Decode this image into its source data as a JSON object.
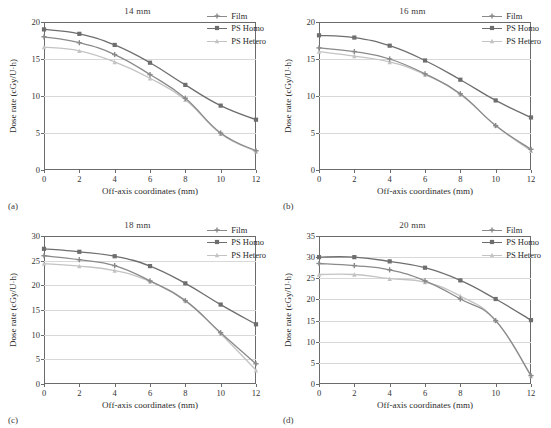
{
  "figure": {
    "panels": [
      {
        "label": "(a)",
        "title": "14 mm",
        "xlabel": "Off-axis coordinates (mm)",
        "ylabel": "Dose rate (cGy/U·h)",
        "ylim": [
          0,
          20
        ],
        "yticks": [
          0,
          5,
          10,
          15,
          20
        ],
        "xlim": [
          0,
          12
        ],
        "xticks": [
          0,
          2,
          4,
          6,
          8,
          10,
          12
        ]
      },
      {
        "label": "(b)",
        "title": "16 mm",
        "xlabel": "Off-axis coordinates (mm)",
        "ylabel": "Dose rate (cGy/U·h)",
        "ylim": [
          0,
          20
        ],
        "yticks": [
          0,
          5,
          10,
          15,
          20
        ],
        "xlim": [
          0,
          12
        ],
        "xticks": [
          0,
          2,
          4,
          6,
          8,
          10,
          12
        ]
      },
      {
        "label": "(c)",
        "title": "18 mm",
        "xlabel": "Off-axis coordinates (mm)",
        "ylabel": "Dose rate (cGy/U·h)",
        "ylim": [
          0,
          30
        ],
        "yticks": [
          0,
          5,
          10,
          15,
          20,
          25,
          30
        ],
        "xlim": [
          0,
          12
        ],
        "xticks": [
          0,
          2,
          4,
          6,
          8,
          10,
          12
        ]
      },
      {
        "label": "(d)",
        "title": "20 mm",
        "xlabel": "Off-axis coordinates (mm)",
        "ylabel": "Dose rate (cGy/U·h)",
        "ylim": [
          0,
          35
        ],
        "yticks": [
          0,
          5,
          10,
          15,
          20,
          25,
          30,
          35
        ],
        "xlim": [
          0,
          12
        ],
        "xticks": [
          0,
          2,
          4,
          6,
          8,
          10,
          12
        ]
      }
    ],
    "legend": {
      "position": "top-right",
      "entries": [
        {
          "name": "Film",
          "color": "#8a8a8a",
          "marker": "plus"
        },
        {
          "name": "PS Homo",
          "color": "#6e6e6e",
          "marker": "square"
        },
        {
          "name": "PS Hetero",
          "color": "#c3c3c3",
          "marker": "triangle"
        }
      ]
    }
  },
  "chart_data": [
    {
      "type": "line",
      "title": "14 mm",
      "panel": "(a)",
      "xlabel": "Off-axis coordinates (mm)",
      "ylabel": "Dose rate (cGy/U·h)",
      "x": [
        0,
        2,
        4,
        6,
        8,
        10,
        12
      ],
      "xlim": [
        0,
        12
      ],
      "ylim": [
        0,
        20
      ],
      "grid": true,
      "legend_position": "top-right",
      "series": [
        {
          "name": "Film",
          "color": "#8a8a8a",
          "marker": "plus",
          "values": [
            18.0,
            17.2,
            15.6,
            12.9,
            9.7,
            5.0,
            2.6
          ]
        },
        {
          "name": "PS Homo",
          "color": "#6e6e6e",
          "marker": "square",
          "values": [
            19.0,
            18.4,
            16.9,
            14.5,
            11.5,
            8.7,
            6.8
          ]
        },
        {
          "name": "PS Hetero",
          "color": "#c3c3c3",
          "marker": "triangle",
          "values": [
            16.6,
            16.1,
            14.6,
            12.4,
            9.5,
            4.9,
            2.5
          ]
        }
      ]
    },
    {
      "type": "line",
      "title": "16 mm",
      "panel": "(b)",
      "xlabel": "Off-axis coordinates (mm)",
      "ylabel": "Dose rate (cGy/U·h)",
      "x": [
        0,
        2,
        4,
        6,
        8,
        10,
        12
      ],
      "xlim": [
        0,
        12
      ],
      "ylim": [
        0,
        20
      ],
      "grid": true,
      "legend_position": "top-right",
      "series": [
        {
          "name": "Film",
          "color": "#8a8a8a",
          "marker": "plus",
          "values": [
            16.5,
            16.0,
            15.0,
            13.0,
            10.3,
            6.0,
            2.8
          ]
        },
        {
          "name": "PS Homo",
          "color": "#6e6e6e",
          "marker": "square",
          "values": [
            18.2,
            17.9,
            16.8,
            14.8,
            12.2,
            9.4,
            7.1
          ]
        },
        {
          "name": "PS Hetero",
          "color": "#c3c3c3",
          "marker": "triangle",
          "values": [
            16.0,
            15.4,
            14.6,
            12.9,
            10.2,
            6.0,
            2.6
          ]
        }
      ]
    },
    {
      "type": "line",
      "title": "18 mm",
      "panel": "(c)",
      "xlabel": "Off-axis coordinates (mm)",
      "ylabel": "Dose rate (cGy/U·h)",
      "x": [
        0,
        2,
        4,
        6,
        8,
        10,
        12
      ],
      "xlim": [
        0,
        12
      ],
      "ylim": [
        0,
        30
      ],
      "grid": true,
      "legend_position": "top-right",
      "series": [
        {
          "name": "Film",
          "color": "#8a8a8a",
          "marker": "plus",
          "values": [
            26.0,
            25.2,
            24.0,
            20.9,
            16.9,
            10.4,
            4.1
          ]
        },
        {
          "name": "PS Homo",
          "color": "#6e6e6e",
          "marker": "square",
          "values": [
            27.4,
            26.8,
            25.9,
            23.9,
            20.4,
            16.1,
            12.1
          ]
        },
        {
          "name": "PS Hetero",
          "color": "#c3c3c3",
          "marker": "triangle",
          "values": [
            24.4,
            23.9,
            23.0,
            20.8,
            16.9,
            10.2,
            2.8
          ]
        }
      ]
    },
    {
      "type": "line",
      "title": "20 mm",
      "panel": "(d)",
      "xlabel": "Off-axis coordinates (mm)",
      "ylabel": "Dose rate (cGy/U·h)",
      "x": [
        0,
        2,
        4,
        6,
        8,
        10,
        12
      ],
      "xlim": [
        0,
        35
      ],
      "ylim": [
        0,
        35
      ],
      "grid": true,
      "legend_position": "top-right",
      "series": [
        {
          "name": "Film",
          "color": "#8a8a8a",
          "marker": "plus",
          "values": [
            28.5,
            28.0,
            27.0,
            24.4,
            20.1,
            15.0,
            2.0
          ]
        },
        {
          "name": "PS Homo",
          "color": "#6e6e6e",
          "marker": "square",
          "values": [
            30.0,
            30.0,
            29.0,
            27.5,
            24.5,
            20.1,
            15.1
          ]
        },
        {
          "name": "PS Hetero",
          "color": "#c3c3c3",
          "marker": "triangle",
          "values": [
            25.9,
            25.9,
            24.9,
            24.1,
            20.8,
            15.0,
            1.9
          ]
        }
      ]
    }
  ]
}
